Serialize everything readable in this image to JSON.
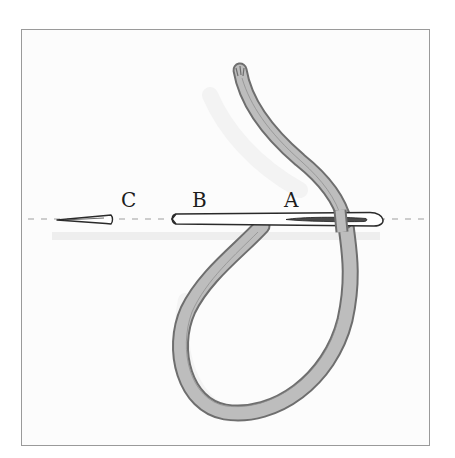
{
  "figure": {
    "type": "illustration",
    "labels": {
      "c": "C",
      "b": "B",
      "a": "A"
    },
    "colors": {
      "background": "#ffffff",
      "frame_border": "#9a9a9a",
      "thread_fill": "#b8b8b8",
      "thread_outline": "#6e6e6e",
      "needle_outline": "#2a2a2a",
      "dashed_line": "#9e9e9e",
      "shadow": "#e6e6e6"
    }
  }
}
